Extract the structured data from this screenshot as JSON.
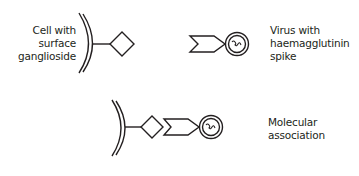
{
  "diagram": {
    "stroke_color": "#231f20",
    "background": "#ffffff",
    "panels": {
      "cell": {
        "label_lines": [
          "Cell with",
          "surface",
          "ganglioside"
        ],
        "shapes": [
          "cell-membrane-arcs",
          "stalk-line",
          "ganglioside-diamond"
        ]
      },
      "virus": {
        "label_lines": [
          "Virus with",
          "haemagglutinin",
          "spike"
        ],
        "shapes": [
          "haemagglutinin-chevron",
          "virus-double-circle",
          "genome-squiggle"
        ]
      },
      "association": {
        "label_lines": [
          "Molecular",
          "association"
        ],
        "shapes": [
          "cell-membrane-arcs",
          "stalk-line",
          "ganglioside-diamond",
          "haemagglutinin-chevron",
          "virus-double-circle",
          "genome-squiggle"
        ]
      }
    }
  }
}
